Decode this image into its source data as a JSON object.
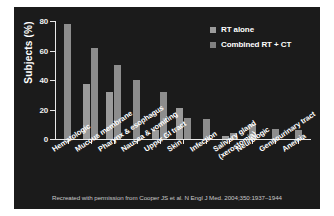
{
  "panel": {
    "background_color": "#1b1b1b",
    "page_background_color": "#ffffff"
  },
  "legend": {
    "position": "top-right",
    "items": [
      {
        "label": "RT alone",
        "color": "#9b9b9b"
      },
      {
        "label": "Combined RT + CT",
        "color": "#808080"
      }
    ]
  },
  "footnote": {
    "text": "Recreated with permission from Cooper JS et al. N Engl J Med. 2004;350:1937–1944"
  },
  "chart_data": {
    "type": "bar",
    "title": "",
    "subtitle": "",
    "xlabel": "",
    "ylabel": "Subjects (%)",
    "ylim": [
      0,
      80
    ],
    "yticks": [
      0,
      20,
      40,
      60,
      80
    ],
    "ytick_labels": [
      "0",
      "20",
      "40",
      "60",
      "80"
    ],
    "grid": false,
    "legend_position": "top-right",
    "categories": [
      "Hematologic",
      "Mucous membrane",
      "Pharynx & esophagus",
      "Nausea & vomiting",
      "Upper GI tract",
      "Skin",
      "Infection",
      "Salivary gland\n(xerostomia)",
      "Neurologic",
      "Genitourinary tract",
      "Anemia"
    ],
    "series": [
      {
        "name": "RT alone",
        "color": "#9b9b9b",
        "values": [
          null,
          37,
          32,
          null,
          6,
          21,
          null,
          2,
          null,
          null,
          null
        ]
      },
      {
        "name": "Combined RT + CT",
        "color": "#8d8d8d",
        "values": [
          78,
          62,
          50,
          40,
          32,
          14,
          13.5,
          4,
          10.5,
          6.5,
          6
        ]
      }
    ]
  }
}
